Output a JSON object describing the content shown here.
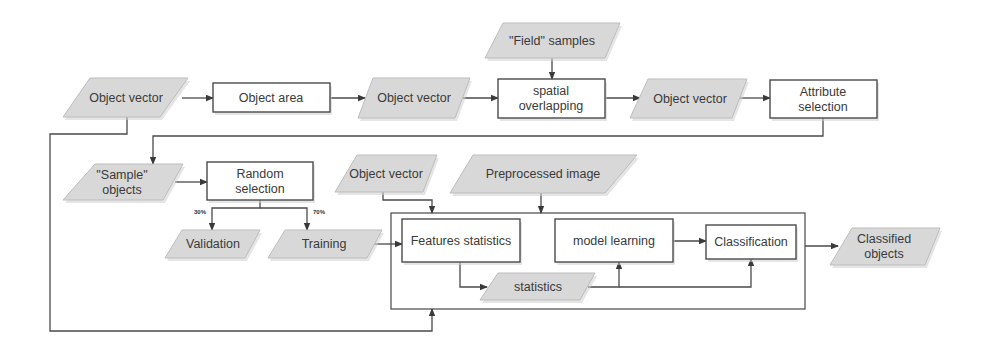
{
  "diagram": {
    "title": "",
    "nodes": [
      {
        "id": "obj_vec_1",
        "type": "data",
        "lines": [
          "Object vector"
        ],
        "pts": [
          [
            90,
            78
          ],
          [
            188,
            78
          ],
          [
            160,
            117
          ],
          [
            63,
            117
          ]
        ],
        "cx": 126,
        "cy": 98
      },
      {
        "id": "obj_area",
        "type": "process",
        "lines": [
          "Object area"
        ],
        "x": 213,
        "y": 83,
        "w": 117,
        "h": 29,
        "cx": 271,
        "cy": 98
      },
      {
        "id": "obj_vec_2",
        "type": "data",
        "lines": [
          "Object vector"
        ],
        "pts": [
          [
            373,
            78
          ],
          [
            470,
            78
          ],
          [
            455,
            118
          ],
          [
            358,
            118
          ]
        ],
        "cx": 414,
        "cy": 98
      },
      {
        "id": "field_samples",
        "type": "data",
        "lines": [
          "\"Field\" samples"
        ],
        "pts": [
          [
            503,
            23
          ],
          [
            620,
            23
          ],
          [
            605,
            58
          ],
          [
            485,
            58
          ]
        ],
        "cx": 552,
        "cy": 41
      },
      {
        "id": "spatial_overlap",
        "type": "process",
        "lines": [
          "spatial",
          "overlapping"
        ],
        "x": 498,
        "y": 79,
        "w": 107,
        "h": 39,
        "cx": 551,
        "cy": 98
      },
      {
        "id": "obj_vec_3",
        "type": "data",
        "lines": [
          "Object vector"
        ],
        "pts": [
          [
            648,
            79
          ],
          [
            747,
            79
          ],
          [
            732,
            118
          ],
          [
            630,
            118
          ]
        ],
        "cx": 690,
        "cy": 99
      },
      {
        "id": "attr_select",
        "type": "process",
        "lines": [
          "Attribute",
          "selection"
        ],
        "x": 770,
        "y": 80,
        "w": 107,
        "h": 38,
        "cx": 823,
        "cy": 99
      },
      {
        "id": "sample_objects",
        "type": "data",
        "lines": [
          "\"Sample\"",
          "objects"
        ],
        "pts": [
          [
            95,
            164
          ],
          [
            183,
            164
          ],
          [
            163,
            200
          ],
          [
            63,
            200
          ]
        ],
        "cx": 122,
        "cy": 182
      },
      {
        "id": "random_select",
        "type": "process",
        "lines": [
          "Random",
          "selection"
        ],
        "x": 207,
        "y": 162,
        "w": 106,
        "h": 38,
        "cx": 260,
        "cy": 181
      },
      {
        "id": "validation",
        "type": "data",
        "lines": [
          "Validation"
        ],
        "pts": [
          [
            182,
            230
          ],
          [
            260,
            230
          ],
          [
            245,
            258
          ],
          [
            165,
            258
          ]
        ],
        "cx": 213,
        "cy": 244
      },
      {
        "id": "training",
        "type": "data",
        "lines": [
          "Training"
        ],
        "pts": [
          [
            285,
            230
          ],
          [
            382,
            230
          ],
          [
            367,
            258
          ],
          [
            268,
            258
          ]
        ],
        "cx": 324,
        "cy": 244
      },
      {
        "id": "obj_vec_4",
        "type": "data",
        "lines": [
          "Object vector"
        ],
        "pts": [
          [
            357,
            155
          ],
          [
            437,
            155
          ],
          [
            423,
            192
          ],
          [
            335,
            192
          ]
        ],
        "cx": 386,
        "cy": 174
      },
      {
        "id": "preproc_image",
        "type": "data",
        "lines": [
          "Preprocessed image"
        ],
        "pts": [
          [
            473,
            155
          ],
          [
            637,
            155
          ],
          [
            605,
            193
          ],
          [
            450,
            193
          ]
        ],
        "cx": 543,
        "cy": 174
      },
      {
        "id": "features_stats",
        "type": "process",
        "lines": [
          "Features statistics"
        ],
        "x": 402,
        "y": 219,
        "w": 118,
        "h": 43,
        "cx": 461,
        "cy": 241
      },
      {
        "id": "model_learning",
        "type": "process",
        "lines": [
          "model learning"
        ],
        "x": 555,
        "y": 219,
        "w": 118,
        "h": 43,
        "cx": 614,
        "cy": 241
      },
      {
        "id": "classification",
        "type": "process",
        "lines": [
          "Classification"
        ],
        "x": 706,
        "y": 225,
        "w": 90,
        "h": 34,
        "cx": 751,
        "cy": 242
      },
      {
        "id": "statistics",
        "type": "data",
        "lines": [
          "statistics"
        ],
        "pts": [
          [
            498,
            273
          ],
          [
            595,
            273
          ],
          [
            580,
            300
          ],
          [
            480,
            300
          ]
        ],
        "cx": 538,
        "cy": 287
      },
      {
        "id": "classified_objects",
        "type": "data",
        "lines": [
          "Classified",
          "objects"
        ],
        "pts": [
          [
            852,
            228
          ],
          [
            940,
            228
          ],
          [
            925,
            265
          ],
          [
            830,
            265
          ]
        ],
        "cx": 884,
        "cy": 246
      }
    ],
    "container": {
      "x": 391,
      "y": 213,
      "w": 414,
      "h": 96
    },
    "edges": [
      {
        "from": "obj_vec_1",
        "to": "obj_area",
        "path": [
          [
            182,
            98
          ],
          [
            213,
            98
          ]
        ],
        "arrow": true
      },
      {
        "from": "obj_area",
        "to": "obj_vec_2",
        "path": [
          [
            330,
            98
          ],
          [
            365,
            98
          ]
        ],
        "arrow": true
      },
      {
        "from": "obj_vec_2",
        "to": "spatial_overlap",
        "path": [
          [
            463,
            98
          ],
          [
            498,
            98
          ]
        ],
        "arrow": true
      },
      {
        "from": "field_samples",
        "to": "spatial_overlap",
        "path": [
          [
            552,
            58
          ],
          [
            552,
            79
          ]
        ],
        "arrow": true
      },
      {
        "from": "spatial_overlap",
        "to": "obj_vec_3",
        "path": [
          [
            605,
            98
          ],
          [
            640,
            98
          ]
        ],
        "arrow": true
      },
      {
        "from": "obj_vec_3",
        "to": "attr_select",
        "path": [
          [
            740,
            98
          ],
          [
            770,
            98
          ]
        ],
        "arrow": true
      },
      {
        "from": "attr_select",
        "to": "sample_objects",
        "path": [
          [
            823,
            118
          ],
          [
            823,
            136
          ],
          [
            153,
            136
          ],
          [
            153,
            164
          ]
        ],
        "arrow": true
      },
      {
        "from": "obj_vec_1",
        "to": "container_bottom",
        "path": [
          [
            127,
            117
          ],
          [
            127,
            134
          ],
          [
            50,
            134
          ],
          [
            50,
            331
          ],
          [
            432,
            331
          ],
          [
            432,
            309
          ]
        ],
        "arrow": true
      },
      {
        "from": "sample_objects",
        "to": "random_select",
        "path": [
          [
            175,
            182
          ],
          [
            207,
            182
          ]
        ],
        "arrow": true
      },
      {
        "from": "random_select",
        "to": "validation",
        "path": [
          [
            260,
            200
          ],
          [
            260,
            208
          ],
          [
            212,
            208
          ],
          [
            212,
            230
          ]
        ],
        "arrow": true,
        "label": "30%",
        "label_pos": [
          200,
          214
        ]
      },
      {
        "from": "random_select",
        "to": "training",
        "path": [
          [
            260,
            208
          ],
          [
            307,
            208
          ],
          [
            307,
            230
          ]
        ],
        "arrow": true,
        "label": "70%",
        "label_pos": [
          319,
          214
        ]
      },
      {
        "from": "training",
        "to": "features_stats",
        "path": [
          [
            374,
            244
          ],
          [
            402,
            244
          ]
        ],
        "arrow": true
      },
      {
        "from": "obj_vec_4",
        "to": "container_top",
        "path": [
          [
            383,
            192
          ],
          [
            383,
            200
          ],
          [
            432,
            200
          ],
          [
            432,
            213
          ]
        ],
        "arrow": true
      },
      {
        "from": "preproc_image",
        "to": "container_top",
        "path": [
          [
            541,
            193
          ],
          [
            541,
            213
          ]
        ],
        "arrow": true
      },
      {
        "from": "features_stats",
        "to": "statistics",
        "path": [
          [
            460,
            262
          ],
          [
            460,
            287
          ],
          [
            487,
            287
          ]
        ],
        "arrow": true
      },
      {
        "from": "statistics",
        "to": "model_learning",
        "path": [
          [
            588,
            287
          ],
          [
            619,
            287
          ],
          [
            619,
            262
          ]
        ],
        "arrow": true
      },
      {
        "from": "statistics",
        "to": "classification",
        "path": [
          [
            619,
            287
          ],
          [
            751,
            287
          ],
          [
            751,
            259
          ]
        ],
        "arrow": true
      },
      {
        "from": "model_learning",
        "to": "classification",
        "path": [
          [
            673,
            241
          ],
          [
            706,
            241
          ]
        ],
        "arrow": true
      },
      {
        "from": "container",
        "to": "classified_objects",
        "path": [
          [
            805,
            246
          ],
          [
            838,
            246
          ]
        ],
        "arrow": true
      }
    ]
  }
}
